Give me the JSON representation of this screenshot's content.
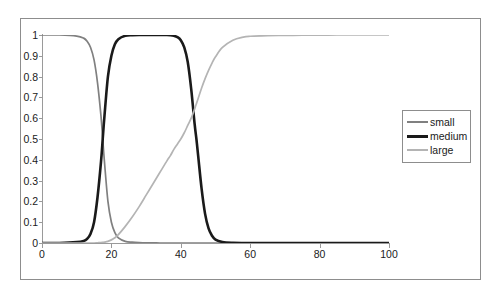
{
  "chart_data": {
    "type": "line",
    "title": "",
    "subtitle": "",
    "xlabel": "",
    "ylabel": "",
    "xlim": [
      0,
      100
    ],
    "ylim": [
      0,
      1
    ],
    "grid": false,
    "legend_position": "right",
    "x_ticks": [
      "0",
      "20",
      "40",
      "60",
      "80",
      "100"
    ],
    "x_tick_values": [
      0,
      20,
      40,
      60,
      80,
      100
    ],
    "y_ticks": [
      "0",
      "0.1",
      "0.2",
      "0.3",
      "0.4",
      "0.5",
      "0.6",
      "0.7",
      "0.8",
      "0.9",
      "1"
    ],
    "y_tick_values": [
      0,
      0.1,
      0.2,
      0.3,
      0.4,
      0.5,
      0.6,
      0.7,
      0.8,
      0.9,
      1
    ],
    "x": [
      0,
      5,
      10,
      12,
      13,
      14,
      15,
      16,
      17,
      17.5,
      18,
      19,
      20,
      21,
      22,
      24,
      26,
      28,
      30,
      32,
      34,
      36,
      37,
      38,
      39,
      40,
      41,
      42,
      43,
      44,
      44.5,
      45,
      46,
      47,
      48,
      49,
      50,
      52,
      55,
      58,
      60,
      65,
      70,
      75,
      80,
      85,
      90,
      95,
      100
    ],
    "series": [
      {
        "name": "small",
        "color": "#808080",
        "linewidth": 1.7,
        "values": [
          1,
          1,
          0.995,
          0.985,
          0.97,
          0.94,
          0.88,
          0.77,
          0.61,
          0.5,
          0.39,
          0.2,
          0.1,
          0.05,
          0.025,
          0.008,
          0.004,
          0.002,
          0.001,
          0.001,
          0,
          0,
          0,
          0,
          0,
          0,
          0,
          0,
          0,
          0,
          0,
          0,
          0,
          0,
          0,
          0,
          0,
          0,
          0,
          0,
          0,
          0,
          0,
          0,
          0,
          0,
          0,
          0,
          0
        ]
      },
      {
        "name": "medium",
        "color": "#1a1a1a",
        "linewidth": 2.6,
        "values": [
          0,
          0,
          0.004,
          0.01,
          0.02,
          0.045,
          0.1,
          0.22,
          0.39,
          0.5,
          0.61,
          0.8,
          0.9,
          0.955,
          0.98,
          0.996,
          0.999,
          1,
          1,
          1,
          1,
          1,
          0.999,
          0.996,
          0.99,
          0.975,
          0.94,
          0.87,
          0.74,
          0.57,
          0.5,
          0.42,
          0.26,
          0.14,
          0.07,
          0.035,
          0.016,
          0.005,
          0.001,
          0,
          0,
          0,
          0,
          0,
          0,
          0,
          0,
          0,
          0
        ]
      },
      {
        "name": "large",
        "color": "#b4b4b4",
        "linewidth": 1.7,
        "values": [
          0,
          0,
          0,
          0,
          0,
          0,
          0,
          0.001,
          0.002,
          0.003,
          0.004,
          0.008,
          0.015,
          0.025,
          0.04,
          0.08,
          0.125,
          0.175,
          0.23,
          0.285,
          0.34,
          0.395,
          0.42,
          0.45,
          0.475,
          0.5,
          0.53,
          0.565,
          0.6,
          0.645,
          0.67,
          0.695,
          0.745,
          0.79,
          0.83,
          0.865,
          0.895,
          0.94,
          0.975,
          0.99,
          0.994,
          0.997,
          0.998,
          0.999,
          0.999,
          1,
          1,
          1,
          1
        ]
      }
    ],
    "legend_entries": [
      {
        "label": "small",
        "color": "#808080"
      },
      {
        "label": "medium",
        "color": "#1a1a1a"
      },
      {
        "label": "large",
        "color": "#b4b4b4"
      }
    ]
  }
}
